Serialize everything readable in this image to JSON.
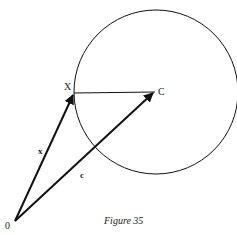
{
  "figure": {
    "caption": "Figure 35",
    "points": {
      "origin": {
        "label": "0",
        "x": 15,
        "y": 221
      },
      "X": {
        "label": "X",
        "x": 74,
        "y": 93
      },
      "C": {
        "label": "C",
        "x": 155,
        "y": 92
      }
    },
    "vectors": {
      "x": {
        "label": "x",
        "from": "origin",
        "to": "X"
      },
      "c": {
        "label": "c",
        "from": "origin",
        "to": "C"
      }
    },
    "circle": {
      "cx": 156,
      "cy": 92,
      "r": 82
    },
    "colors": {
      "stroke": "#111111",
      "background": "#ffffff"
    }
  }
}
